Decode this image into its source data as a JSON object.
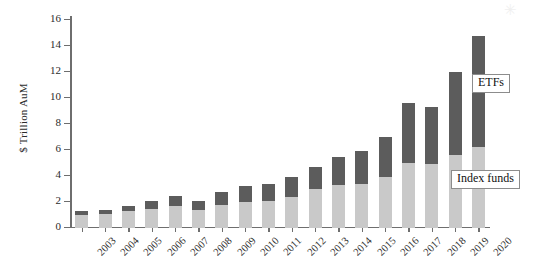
{
  "chart_data": {
    "type": "bar",
    "subtype": "stacked-vertical",
    "title": "",
    "xlabel": "",
    "ylabel": "$ Trillion AuM",
    "ylim": [
      0,
      16
    ],
    "yticks": [
      0,
      2,
      4,
      6,
      8,
      10,
      12,
      14,
      16
    ],
    "grid": false,
    "legend_position": "inline-annotations",
    "categories": [
      "2003",
      "2004",
      "2005",
      "2006",
      "2007",
      "2008",
      "2009",
      "2010",
      "2011",
      "2012",
      "2013",
      "2014",
      "2015",
      "2016",
      "2017",
      "2018",
      "2019",
      "2020"
    ],
    "series": [
      {
        "name": "Index funds",
        "color": "#c9c9c9",
        "values": [
          1.0,
          1.1,
          1.3,
          1.5,
          1.7,
          1.4,
          1.8,
          2.0,
          2.1,
          2.4,
          3.0,
          3.3,
          3.4,
          3.9,
          5.0,
          4.9,
          5.6,
          6.2
        ]
      },
      {
        "name": "ETFs",
        "color": "#5c5c5c",
        "values": [
          0.3,
          0.3,
          0.4,
          0.6,
          0.8,
          0.7,
          1.0,
          1.2,
          1.3,
          1.5,
          1.7,
          2.2,
          2.5,
          3.1,
          4.6,
          4.4,
          6.4,
          8.6
        ]
      }
    ],
    "totals": [
      1.3,
      1.4,
      1.7,
      2.1,
      2.5,
      2.1,
      2.8,
      3.2,
      3.4,
      3.9,
      4.7,
      5.5,
      5.9,
      7.0,
      9.6,
      9.3,
      12.0,
      14.8
    ],
    "annotations": [
      {
        "id": "etfs",
        "label": "ETFs",
        "points_to": "ETFs"
      },
      {
        "id": "index",
        "label": "Index funds",
        "points_to": "Index funds"
      }
    ]
  },
  "axis": {
    "y_label": "$ Trillion AuM"
  },
  "callouts": {
    "etfs": "ETFs",
    "index_funds": "Index funds"
  },
  "marks": {
    "scan_artifact": "✳"
  }
}
